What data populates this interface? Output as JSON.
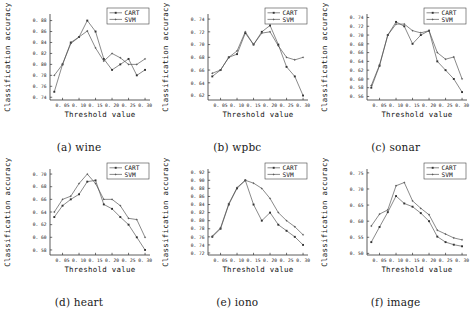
{
  "figure": {
    "panel_count": 6,
    "axis": {
      "xlabel": "Threshold value",
      "ylabel": "Classification accuracy"
    },
    "legend": {
      "cart": "CART",
      "svm": "SVM"
    }
  },
  "chart_data": [
    {
      "type": "line",
      "title": "(a) wine",
      "xlabel": "Threshold value",
      "ylabel": "Classification accuracy",
      "x": [
        0.025,
        0.05,
        0.075,
        0.1,
        0.125,
        0.15,
        0.175,
        0.2,
        0.225,
        0.25,
        0.275,
        0.3
      ],
      "xticks": [
        "0. 05",
        "0. 10",
        "0. 15",
        "0. 20",
        "0. 25",
        "0. 30"
      ],
      "xtickvalues": [
        0.05,
        0.1,
        0.15,
        0.2,
        0.25,
        0.3
      ],
      "yticks": [
        "0. 74",
        "0. 76",
        "0. 78",
        "0. 80",
        "0. 82",
        "0. 84",
        "0. 86",
        "0. 88"
      ],
      "ytickvalues": [
        0.74,
        0.76,
        0.78,
        0.8,
        0.82,
        0.84,
        0.86,
        0.88
      ],
      "ylim": [
        0.735,
        0.892
      ],
      "xlim": [
        0.012,
        0.315
      ],
      "grid": false,
      "legend_position": "top-right",
      "series": [
        {
          "name": "CART",
          "values": [
            0.75,
            0.8,
            0.84,
            0.85,
            0.88,
            0.86,
            0.81,
            0.79,
            0.8,
            0.81,
            0.78,
            0.79
          ]
        },
        {
          "name": "SVM",
          "values": [
            0.78,
            0.8,
            0.838,
            0.85,
            0.861,
            0.83,
            0.806,
            0.82,
            0.812,
            0.8,
            0.8,
            0.81
          ]
        }
      ]
    },
    {
      "type": "line",
      "title": "(b) wpbc",
      "xlabel": "Threshold value",
      "ylabel": "Classification accuracy",
      "x": [
        0.025,
        0.05,
        0.075,
        0.1,
        0.125,
        0.15,
        0.175,
        0.2,
        0.225,
        0.25,
        0.275,
        0.3
      ],
      "xticks": [
        "0. 05",
        "0. 10",
        "0. 15",
        "0. 20",
        "0. 25",
        "0. 30"
      ],
      "xtickvalues": [
        0.05,
        0.1,
        0.15,
        0.2,
        0.25,
        0.3
      ],
      "yticks": [
        "0. 62",
        "0. 64",
        "0. 66",
        "0. 68",
        "0. 70",
        "0. 72",
        "0. 74"
      ],
      "ytickvalues": [
        0.62,
        0.64,
        0.66,
        0.68,
        0.7,
        0.72,
        0.74
      ],
      "ylim": [
        0.613,
        0.748
      ],
      "xlim": [
        0.012,
        0.315
      ],
      "grid": false,
      "legend_position": "top-right",
      "series": [
        {
          "name": "CART",
          "values": [
            0.65,
            0.66,
            0.68,
            0.685,
            0.718,
            0.7,
            0.72,
            0.73,
            0.7,
            0.665,
            0.65,
            0.62
          ]
        },
        {
          "name": "SVM",
          "values": [
            0.655,
            0.66,
            0.68,
            0.69,
            0.72,
            0.7,
            0.718,
            0.72,
            0.698,
            0.68,
            0.676,
            0.68
          ]
        }
      ]
    },
    {
      "type": "line",
      "title": "(c) sonar",
      "xlabel": "Threshold value",
      "ylabel": "Classification accuracy",
      "x": [
        0.025,
        0.05,
        0.075,
        0.1,
        0.125,
        0.15,
        0.175,
        0.2,
        0.225,
        0.25,
        0.275,
        0.3
      ],
      "xticks": [
        "0. 05",
        "0. 10",
        "0. 15",
        "0. 20",
        "0. 25",
        "0. 30"
      ],
      "xtickvalues": [
        0.05,
        0.1,
        0.15,
        0.2,
        0.25,
        0.3
      ],
      "yticks": [
        "0. 56",
        "0. 58",
        "0. 60",
        "0. 62",
        "0. 64",
        "0. 66",
        "0. 68",
        "0. 70",
        "0. 72",
        "0. 74"
      ],
      "ytickvalues": [
        0.56,
        0.58,
        0.6,
        0.62,
        0.64,
        0.66,
        0.68,
        0.7,
        0.72,
        0.74
      ],
      "ylim": [
        0.552,
        0.748
      ],
      "xlim": [
        0.012,
        0.315
      ],
      "grid": false,
      "legend_position": "top-right",
      "series": [
        {
          "name": "CART",
          "values": [
            0.58,
            0.63,
            0.7,
            0.73,
            0.72,
            0.68,
            0.7,
            0.71,
            0.64,
            0.62,
            0.6,
            0.57
          ]
        },
        {
          "name": "SVM",
          "values": [
            0.585,
            0.632,
            0.7,
            0.725,
            0.725,
            0.71,
            0.705,
            0.71,
            0.66,
            0.645,
            0.65,
            0.6
          ]
        }
      ]
    },
    {
      "type": "line",
      "title": "(d) heart",
      "xlabel": "Threshold value",
      "ylabel": "Classification accuracy",
      "x": [
        0.025,
        0.05,
        0.075,
        0.1,
        0.125,
        0.15,
        0.175,
        0.2,
        0.225,
        0.25,
        0.275,
        0.3
      ],
      "xticks": [
        "0. 05",
        "0. 10",
        "0. 15",
        "0. 20",
        "0. 25",
        "0. 30"
      ],
      "xtickvalues": [
        0.05,
        0.1,
        0.15,
        0.2,
        0.25,
        0.3
      ],
      "yticks": [
        "0. 58",
        "0. 60",
        "0. 62",
        "0. 64",
        "0. 66",
        "0. 68",
        "0. 70"
      ],
      "ytickvalues": [
        0.58,
        0.6,
        0.62,
        0.64,
        0.66,
        0.68,
        0.7
      ],
      "ylim": [
        0.572,
        0.708
      ],
      "xlim": [
        0.012,
        0.315
      ],
      "grid": false,
      "legend_position": "top-right",
      "series": [
        {
          "name": "CART",
          "values": [
            0.632,
            0.65,
            0.66,
            0.668,
            0.688,
            0.69,
            0.652,
            0.645,
            0.632,
            0.62,
            0.6,
            0.58
          ]
        },
        {
          "name": "SVM",
          "values": [
            0.64,
            0.66,
            0.665,
            0.685,
            0.7,
            0.685,
            0.66,
            0.66,
            0.65,
            0.63,
            0.628,
            0.6
          ]
        }
      ]
    },
    {
      "type": "line",
      "title": "(e) iono",
      "xlabel": "Threshold value",
      "ylabel": "Classification accuracy",
      "x": [
        0.025,
        0.05,
        0.075,
        0.1,
        0.125,
        0.15,
        0.175,
        0.2,
        0.225,
        0.25,
        0.275,
        0.3
      ],
      "xticks": [
        "0. 05",
        "0. 10",
        "0. 15",
        "0. 20",
        "0. 25",
        "0. 30"
      ],
      "xtickvalues": [
        0.05,
        0.1,
        0.15,
        0.2,
        0.25,
        0.3
      ],
      "yticks": [
        "0. 72",
        "0. 74",
        "0. 76",
        "0. 78",
        "0. 80",
        "0. 82",
        "0. 84",
        "0. 86",
        "0. 88",
        "0. 90",
        "0. 92"
      ],
      "ytickvalues": [
        0.72,
        0.74,
        0.76,
        0.78,
        0.8,
        0.82,
        0.84,
        0.86,
        0.88,
        0.9,
        0.92
      ],
      "ylim": [
        0.715,
        0.928
      ],
      "xlim": [
        0.012,
        0.315
      ],
      "grid": false,
      "legend_position": "top-right",
      "series": [
        {
          "name": "CART",
          "values": [
            0.76,
            0.78,
            0.84,
            0.88,
            0.9,
            0.84,
            0.8,
            0.82,
            0.79,
            0.775,
            0.76,
            0.74
          ]
        },
        {
          "name": "SVM",
          "values": [
            0.762,
            0.782,
            0.842,
            0.882,
            0.9,
            0.893,
            0.88,
            0.855,
            0.82,
            0.8,
            0.785,
            0.765
          ]
        }
      ]
    },
    {
      "type": "line",
      "title": "(f) image",
      "xlabel": "Threshold value",
      "ylabel": "Classification accuracy",
      "x": [
        0.025,
        0.05,
        0.075,
        0.1,
        0.125,
        0.15,
        0.175,
        0.2,
        0.225,
        0.25,
        0.275,
        0.3
      ],
      "xticks": [
        "0. 05",
        "0. 10",
        "0. 15",
        "0. 20",
        "0. 25",
        "0. 30"
      ],
      "xtickvalues": [
        0.05,
        0.1,
        0.15,
        0.2,
        0.25,
        0.3
      ],
      "yticks": [
        "0. 50",
        "0. 55",
        "0. 60",
        "0. 65",
        "0. 70",
        "0. 75"
      ],
      "ytickvalues": [
        0.5,
        0.55,
        0.6,
        0.65,
        0.7,
        0.75
      ],
      "ylim": [
        0.495,
        0.762
      ],
      "xlim": [
        0.012,
        0.315
      ],
      "grid": false,
      "legend_position": "top-right",
      "series": [
        {
          "name": "CART",
          "values": [
            0.535,
            0.582,
            0.628,
            0.678,
            0.655,
            0.645,
            0.625,
            0.6,
            0.552,
            0.535,
            0.527,
            0.522
          ]
        },
        {
          "name": "SVM",
          "values": [
            0.585,
            0.622,
            0.635,
            0.71,
            0.72,
            0.663,
            0.64,
            0.62,
            0.572,
            0.56,
            0.548,
            0.542
          ]
        }
      ]
    }
  ]
}
